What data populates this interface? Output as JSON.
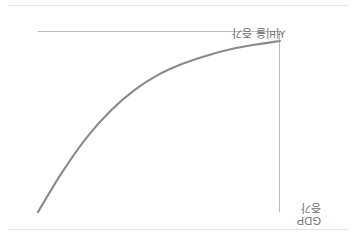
{
  "figure": {
    "orientation_note": "upside-down",
    "background_color": "#ffffff",
    "curve_color": "#8a8a8a",
    "axis_color": "#b9bbbe",
    "rule_color": "#e2e3e5"
  },
  "labels": {
    "y_axis": "서비율 증가",
    "x_axis_line1": "GDP",
    "x_axis_line2": "증가"
  },
  "chart_data": {
    "type": "line",
    "title": "",
    "subtitle": "",
    "xlabel": "GDP 증가",
    "ylabel": "서비율 증가",
    "grid": false,
    "legend": null,
    "axis_ticks": {
      "x": [],
      "y": []
    },
    "xlim": [
      0,
      10
    ],
    "ylim": [
      0,
      10
    ],
    "annotations": [],
    "series": [
      {
        "name": "서비율 증가",
        "color": "#8a8a8a",
        "x": [
          0,
          1,
          2,
          3,
          4,
          5,
          6,
          7,
          8,
          9,
          10
        ],
        "y": [
          0.55,
          0.75,
          1.0,
          1.35,
          1.8,
          2.4,
          3.25,
          4.4,
          5.9,
          7.8,
          10.0
        ]
      }
    ]
  }
}
